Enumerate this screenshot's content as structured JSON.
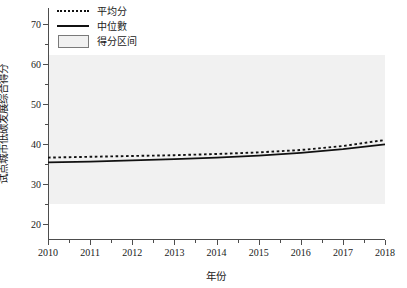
{
  "chart_data": {
    "type": "line",
    "title": "",
    "xlabel": "年份",
    "ylabel": "试点城市低碳发展综合得分",
    "x": [
      2010,
      2011,
      2012,
      2013,
      2014,
      2015,
      2016,
      2017,
      2018
    ],
    "xlim": [
      2010,
      2018
    ],
    "ylim": [
      16,
      74
    ],
    "yticks": [
      20,
      30,
      40,
      50,
      60,
      70
    ],
    "ytick_labels": [
      "20",
      "30",
      "40",
      "50",
      "60",
      "70"
    ],
    "xticks": [
      2010,
      2011,
      2012,
      2013,
      2014,
      2015,
      2016,
      2017,
      2018
    ],
    "xtick_labels": [
      "2010",
      "2011",
      "2012",
      "2013",
      "2014",
      "2015",
      "2016",
      "2017",
      "2018"
    ],
    "grid": false,
    "legend_position": "top-left",
    "series": [
      {
        "name": "平均分",
        "style": "dotted",
        "color": "#111111",
        "values": [
          36.6,
          36.8,
          37.0,
          37.2,
          37.5,
          37.9,
          38.5,
          39.5,
          41.0
        ]
      },
      {
        "name": "中位數",
        "style": "solid",
        "color": "#111111",
        "values": [
          35.4,
          35.6,
          35.9,
          36.2,
          36.6,
          37.1,
          37.8,
          38.7,
          39.9
        ]
      }
    ],
    "band": {
      "name": "得分区间",
      "color": "#f1f1f1",
      "lower": [
        25.0,
        25.0,
        25.0,
        25.0,
        25.0,
        25.0,
        25.0,
        25.0,
        25.0
      ],
      "upper": [
        62.2,
        62.2,
        62.2,
        62.2,
        62.2,
        62.2,
        62.2,
        62.2,
        62.2
      ]
    }
  },
  "legend": {
    "items": [
      {
        "label": "平均分",
        "key": "dotted-line-key"
      },
      {
        "label": "中位數",
        "key": "solid-line-key"
      },
      {
        "label": "得分区间",
        "key": "band-patch-key"
      }
    ]
  }
}
